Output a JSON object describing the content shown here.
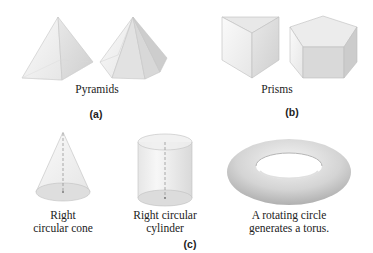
{
  "panels": {
    "a": {
      "label": "(a)",
      "caption": "Pyramids",
      "shapes": [
        "square-pyramid",
        "hexagonal-pyramid"
      ]
    },
    "b": {
      "label": "(b)",
      "caption": "Prisms",
      "shapes": [
        "triangular-prism",
        "pentagonal-prism"
      ]
    },
    "c": {
      "label": "(c)",
      "items": [
        {
          "shape": "cone",
          "caption_line1": "Right",
          "caption_line2": "circular cone"
        },
        {
          "shape": "cylinder",
          "caption_line1": "Right circular",
          "caption_line2": "cylinder"
        },
        {
          "shape": "torus",
          "caption_line1": "A rotating circle",
          "caption_line2": "generates a torus."
        }
      ]
    }
  },
  "colors": {
    "face_light": "#f2f2f2",
    "face_mid": "#e3e3e3",
    "face_dark": "#d2d2d2",
    "edge": "#b8b8b8",
    "axis": "#8a8a8a",
    "torus": "#c9c9c9"
  }
}
